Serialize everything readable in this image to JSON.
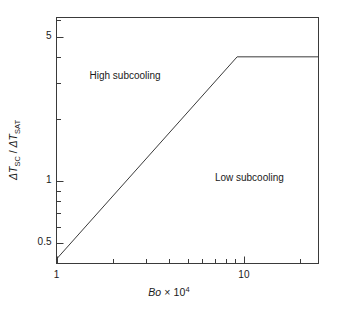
{
  "figure": {
    "background_color": "#ffffff",
    "line_color": "#3a3a3a",
    "axis_color": "#3a3a3a",
    "text_color": "#1a1a1a"
  },
  "axes": {
    "x": {
      "title_prefix": "Bo",
      "title_mult": " × 10",
      "title_exponent": "4",
      "scale": "log",
      "tick_labels": [
        "1",
        "10"
      ],
      "tick_values": [
        1,
        10
      ]
    },
    "y": {
      "title_part1": "ΔT",
      "title_sub1": "SC",
      "title_sep": " / ",
      "title_part2": "ΔT",
      "title_sub2": "SAT",
      "scale": "log",
      "tick_labels": [
        "5",
        "1",
        "0.5"
      ],
      "tick_values": [
        5,
        1,
        0.5
      ]
    }
  },
  "annotations": [
    {
      "text": "High subcooling",
      "x": 1.5,
      "y": 3.2
    },
    {
      "text": "Low subcooling",
      "x": 7.0,
      "y": 1.02
    }
  ],
  "chart_data": {
    "type": "line",
    "title": "",
    "xlabel": "Bo × 10^4",
    "ylabel": "ΔT_SC / ΔT_SAT",
    "xscale": "log",
    "yscale": "log",
    "xlim": [
      1,
      25
    ],
    "ylim": [
      0.4,
      6.2
    ],
    "grid": false,
    "legend": "none",
    "xticks": [
      1,
      2,
      3,
      4,
      5,
      6,
      7,
      8,
      9,
      10,
      20
    ],
    "xtick_labels": [
      "1",
      "",
      "",
      "",
      "",
      "",
      "",
      "",
      "",
      "10",
      ""
    ],
    "yticks": [
      0.5,
      0.6,
      0.7,
      0.8,
      0.9,
      1,
      2,
      3,
      4,
      5,
      6
    ],
    "ytick_labels": [
      "0.5",
      "",
      "",
      "",
      "",
      "1",
      "",
      "",
      "",
      "5",
      ""
    ],
    "series": [
      {
        "name": "subcooling boundary",
        "x": [
          1.0,
          9.2,
          25.0
        ],
        "y": [
          0.42,
          4.0,
          4.0
        ]
      }
    ],
    "regions": [
      {
        "label": "High subcooling",
        "position": "above-left"
      },
      {
        "label": "Low subcooling",
        "position": "below-right"
      }
    ]
  }
}
